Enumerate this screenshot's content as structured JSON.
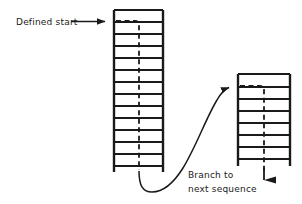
{
  "diagram": {
    "background_color": "#ffffff",
    "stroke_color": "#1a1a1a",
    "labels": {
      "defined_start": "Defined start",
      "branch_line_1": "Branch to",
      "branch_line_2": "next sequence"
    },
    "ladders": [
      {
        "name": "primary-ladder",
        "left_rail_x": 114,
        "right_rail_x": 163,
        "top_y": 10,
        "bottom_y": 172,
        "rung_count": 13,
        "rung_ys": [
          22,
          34,
          46,
          58,
          70,
          82,
          94,
          106,
          118,
          130,
          142,
          154,
          166
        ]
      },
      {
        "name": "secondary-ladder",
        "left_rail_x": 238,
        "right_rail_x": 290,
        "top_y": 74,
        "bottom_y": 166,
        "rung_count": 7,
        "rung_ys": [
          87,
          99,
          111,
          123,
          135,
          147,
          159
        ]
      }
    ],
    "annotations": {
      "defined_start_arrow": {
        "line_from_x": 70,
        "line_to_x": 113,
        "y": 22
      },
      "branch_curve": {
        "from_x": 139,
        "from_y": 172,
        "to_x": 231,
        "to_y": 87
      },
      "exit_arrow": {
        "x": 264,
        "from_y": 166,
        "to_y": 192
      }
    },
    "dashed_paths": [
      {
        "name": "primary-start-dash",
        "from": "rail-left",
        "down_to_y": 172
      },
      {
        "name": "secondary-start-dash",
        "from": "rail-left",
        "down_to_y": 192
      }
    ]
  }
}
